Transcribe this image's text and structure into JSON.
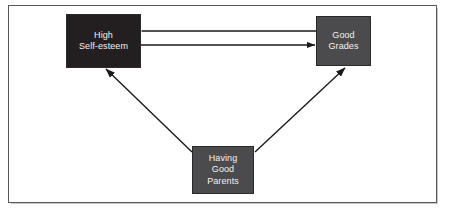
{
  "figure": {
    "type": "path-diagram",
    "background_color": "#ffffff",
    "frame_color": "#58585a",
    "nodes": [
      {
        "id": "self_esteem",
        "label": "High\nSelf-esteem",
        "fill_color": "#231f20",
        "text_color": "#f2f2f2",
        "position": "top-left"
      },
      {
        "id": "good_grades",
        "label": "Good\nGrades",
        "fill_color": "#4b4b4d",
        "text_color": "#f2f2f2",
        "position": "top-right"
      },
      {
        "id": "good_parents",
        "label": "Having\nGood\nParents",
        "fill_color": "#4b4b4d",
        "text_color": "#f2f2f2",
        "position": "bottom-center"
      }
    ],
    "arrows": [
      {
        "id": "grades-to-self-esteem",
        "from": "good_grades",
        "to": "self_esteem",
        "direction": "left",
        "style": "straight-horizontal"
      },
      {
        "id": "self-esteem-to-grades",
        "from": "self_esteem",
        "to": "good_grades",
        "direction": "right",
        "style": "straight-horizontal"
      },
      {
        "id": "parents-to-self-esteem",
        "from": "good_parents",
        "to": "self_esteem",
        "direction": "up-left",
        "style": "straight-diagonal"
      },
      {
        "id": "parents-to-grades",
        "from": "good_parents",
        "to": "good_grades",
        "direction": "up-right",
        "style": "straight-diagonal"
      }
    ],
    "line_color": "#1a1a1a"
  }
}
